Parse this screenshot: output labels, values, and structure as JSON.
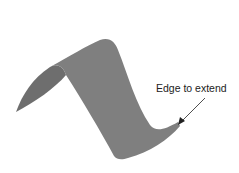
{
  "diagram": {
    "annotation": "Edge to extend",
    "surface_color": "#7f7f7f",
    "shadow_color": "#6e6e6e",
    "arrow_color": "#222222"
  }
}
